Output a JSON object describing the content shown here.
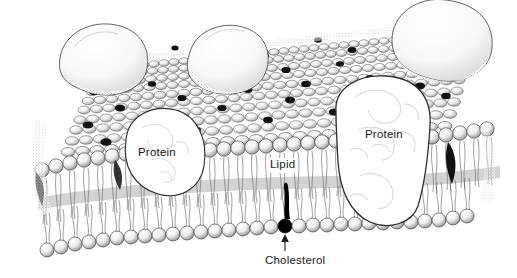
{
  "figure": {
    "style": "pen-and-ink scientific illustration",
    "background_color": "#ffffff",
    "ink_color": "#1a1a1a"
  },
  "labels": {
    "protein_left": "Protein",
    "protein_right": "Protein",
    "lipid": "Lipid",
    "cholesterol": "Cholesterol"
  },
  "structures": {
    "membrane": "phospholipid-bilayer",
    "upper_leaflet": "outer lipid leaflet shown in perspective from above",
    "lower_leaflet": "inner lipid leaflet shown in cross-section",
    "surface_proteins": 4,
    "transmembrane_proteins": 1,
    "cholesterol_color": "#000000",
    "phospholipid_head_color": "#f2f2f2"
  }
}
